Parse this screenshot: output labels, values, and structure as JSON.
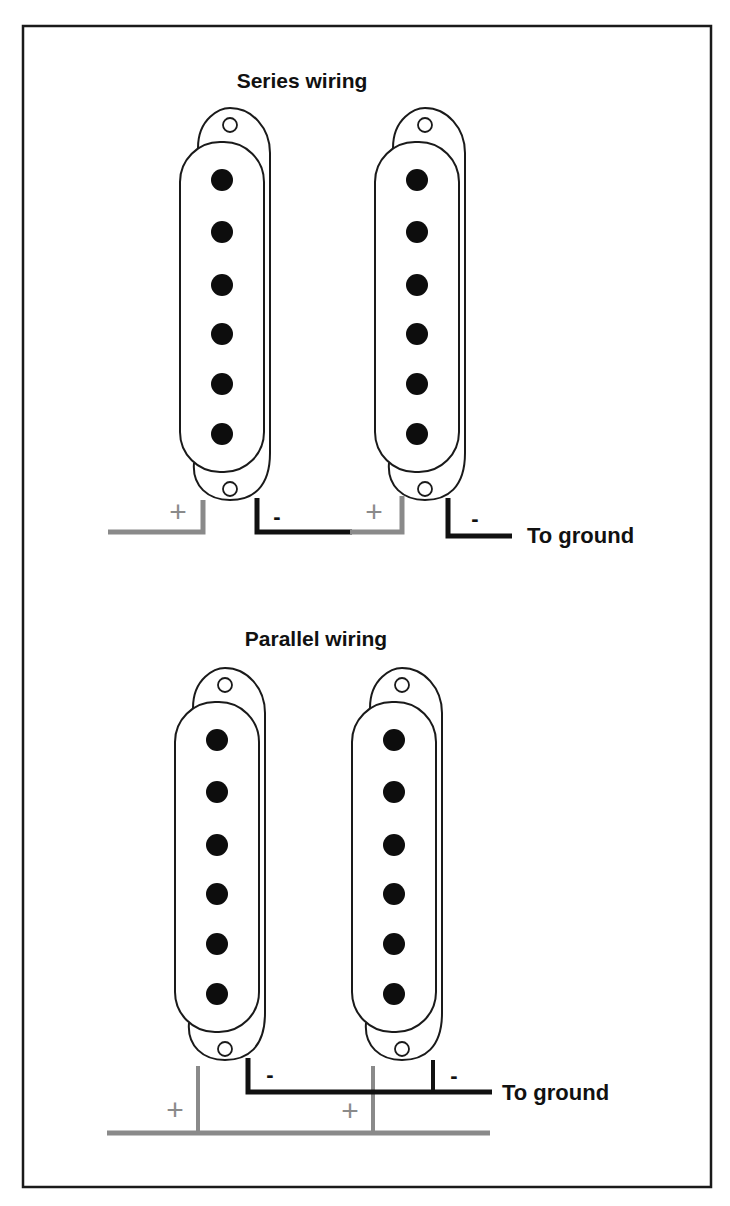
{
  "colors": {
    "background": "#ffffff",
    "frame": "#1a1a1a",
    "outline": "#1a1a1a",
    "pole": "#0d0d0d",
    "positive_wire": "#8a8a8a",
    "negative_wire": "#111111"
  },
  "sections": [
    {
      "id": "series",
      "title": "Series wiring",
      "ground_label": "To ground",
      "pickups": [
        {
          "name": "pickup-1",
          "poles": 6,
          "positive_label": "+",
          "negative_label": "-"
        },
        {
          "name": "pickup-2",
          "poles": 6,
          "positive_label": "+",
          "negative_label": "-"
        }
      ]
    },
    {
      "id": "parallel",
      "title": "Parallel wiring",
      "ground_label": "To ground",
      "pickups": [
        {
          "name": "pickup-1",
          "poles": 6,
          "positive_label": "+",
          "negative_label": "-"
        },
        {
          "name": "pickup-2",
          "poles": 6,
          "positive_label": "+",
          "negative_label": "-"
        }
      ]
    }
  ]
}
